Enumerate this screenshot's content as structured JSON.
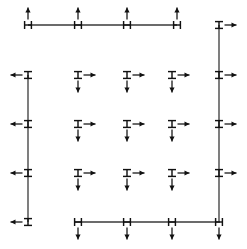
{
  "diagram": {
    "type": "structural-node-restraint-grid",
    "canvas": {
      "width": 247,
      "height": 249,
      "background": "#ffffff"
    },
    "colors": {
      "line": "#3a3a3a",
      "node": "#111111",
      "arrow": "#111111",
      "background": "#ffffff"
    },
    "geometry": {
      "column_x": [
        28,
        78,
        127,
        172,
        219
      ],
      "row_y": [
        25,
        75,
        124,
        173,
        222
      ],
      "top_line": {
        "x1": 28,
        "x2": 177,
        "y": 25
      },
      "left_line": {
        "x": 28,
        "y1": 75,
        "y2": 222
      },
      "right_line": {
        "x": 219,
        "y1": 25,
        "y2": 222
      },
      "bottom_line": {
        "x1": 75,
        "x2": 220,
        "y": 222
      }
    },
    "legend": {
      "node_symbol": "double-bar-node",
      "arrow_up": "arrow-up",
      "arrow_down": "arrow-down",
      "arrow_left": "arrow-left",
      "arrow_right": "arrow-right"
    },
    "members": [
      {
        "id": "top-edge-member",
        "orientation": "horizontal",
        "x1": 28,
        "y1": 25,
        "x2": 177,
        "y2": 25
      },
      {
        "id": "left-edge-member",
        "orientation": "vertical",
        "x1": 28,
        "y1": 75,
        "x2": 28,
        "y2": 222
      },
      {
        "id": "right-edge-member",
        "orientation": "vertical",
        "x1": 219,
        "y1": 25,
        "x2": 219,
        "y2": 222
      },
      {
        "id": "bottom-edge-member",
        "orientation": "horizontal",
        "x1": 75,
        "y1": 222,
        "x2": 220,
        "y2": 222
      }
    ],
    "nodes": [
      {
        "id": "node-top-1",
        "group": "top-edge",
        "x": 28,
        "y": 25,
        "marker": "horizontal-node",
        "arrows": [
          "up"
        ]
      },
      {
        "id": "node-top-2",
        "group": "top-edge",
        "x": 78,
        "y": 25,
        "marker": "horizontal-node",
        "arrows": [
          "up"
        ]
      },
      {
        "id": "node-top-3",
        "group": "top-edge",
        "x": 127,
        "y": 25,
        "marker": "horizontal-node",
        "arrows": [
          "up"
        ]
      },
      {
        "id": "node-top-4",
        "group": "top-edge",
        "x": 177,
        "y": 25,
        "marker": "horizontal-node",
        "arrows": [
          "up"
        ]
      },
      {
        "id": "node-left-1",
        "group": "left-edge",
        "x": 28,
        "y": 75,
        "marker": "vertical-node",
        "arrows": [
          "left"
        ]
      },
      {
        "id": "node-left-2",
        "group": "left-edge",
        "x": 28,
        "y": 124,
        "marker": "vertical-node",
        "arrows": [
          "left"
        ]
      },
      {
        "id": "node-left-3",
        "group": "left-edge",
        "x": 28,
        "y": 173,
        "marker": "vertical-node",
        "arrows": [
          "left"
        ]
      },
      {
        "id": "node-left-4",
        "group": "left-edge",
        "x": 28,
        "y": 222,
        "marker": "vertical-node",
        "arrows": [
          "left"
        ]
      },
      {
        "id": "node-right-1",
        "group": "right-edge",
        "x": 219,
        "y": 25,
        "marker": "vertical-node",
        "arrows": [
          "right"
        ]
      },
      {
        "id": "node-right-2",
        "group": "right-edge",
        "x": 219,
        "y": 75,
        "marker": "vertical-node",
        "arrows": [
          "right"
        ]
      },
      {
        "id": "node-right-3",
        "group": "right-edge",
        "x": 219,
        "y": 124,
        "marker": "vertical-node",
        "arrows": [
          "right"
        ]
      },
      {
        "id": "node-right-4",
        "group": "right-edge",
        "x": 219,
        "y": 173,
        "marker": "vertical-node",
        "arrows": [
          "right"
        ]
      },
      {
        "id": "node-bottom-1",
        "group": "bottom-edge",
        "x": 78,
        "y": 222,
        "marker": "horizontal-node",
        "arrows": [
          "down"
        ]
      },
      {
        "id": "node-bottom-2",
        "group": "bottom-edge",
        "x": 127,
        "y": 222,
        "marker": "horizontal-node",
        "arrows": [
          "down"
        ]
      },
      {
        "id": "node-bottom-3",
        "group": "bottom-edge",
        "x": 172,
        "y": 222,
        "marker": "horizontal-node",
        "arrows": [
          "down"
        ]
      },
      {
        "id": "node-bottom-4",
        "group": "bottom-edge",
        "x": 219,
        "y": 222,
        "marker": "horizontal-node",
        "arrows": [
          "down"
        ]
      },
      {
        "id": "node-interior-1-1",
        "group": "interior",
        "x": 78,
        "y": 75,
        "marker": "vertical-node",
        "arrows": [
          "right",
          "down"
        ]
      },
      {
        "id": "node-interior-1-2",
        "group": "interior",
        "x": 127,
        "y": 75,
        "marker": "vertical-node",
        "arrows": [
          "right",
          "down"
        ]
      },
      {
        "id": "node-interior-1-3",
        "group": "interior",
        "x": 172,
        "y": 75,
        "marker": "vertical-node",
        "arrows": [
          "right",
          "down"
        ]
      },
      {
        "id": "node-interior-2-1",
        "group": "interior",
        "x": 78,
        "y": 124,
        "marker": "vertical-node",
        "arrows": [
          "right",
          "down"
        ]
      },
      {
        "id": "node-interior-2-2",
        "group": "interior",
        "x": 127,
        "y": 124,
        "marker": "vertical-node",
        "arrows": [
          "right",
          "down"
        ]
      },
      {
        "id": "node-interior-2-3",
        "group": "interior",
        "x": 172,
        "y": 124,
        "marker": "vertical-node",
        "arrows": [
          "right",
          "down"
        ]
      },
      {
        "id": "node-interior-3-1",
        "group": "interior",
        "x": 78,
        "y": 173,
        "marker": "vertical-node",
        "arrows": [
          "right",
          "down"
        ]
      },
      {
        "id": "node-interior-3-2",
        "group": "interior",
        "x": 127,
        "y": 173,
        "marker": "vertical-node",
        "arrows": [
          "right",
          "down"
        ]
      },
      {
        "id": "node-interior-3-3",
        "group": "interior",
        "x": 172,
        "y": 173,
        "marker": "vertical-node",
        "arrows": [
          "right",
          "down"
        ]
      }
    ]
  }
}
